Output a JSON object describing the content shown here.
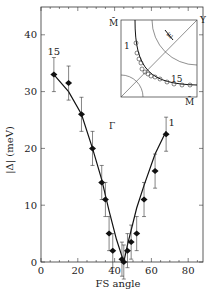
{
  "chart_data": {
    "type": "scatter",
    "title": "",
    "xlabel": "FS angle",
    "ylabel": "|Δ| (meV)",
    "xlim": [
      0,
      90
    ],
    "ylim": [
      0,
      45
    ],
    "xticks": [
      0,
      20,
      40,
      60,
      80
    ],
    "yticks": [
      0,
      10,
      20,
      30,
      40
    ],
    "grid": false,
    "series": [
      {
        "name": "gap data",
        "marker": "filled-diamond",
        "x": [
          7,
          15,
          22,
          28,
          33,
          35,
          37,
          39,
          44,
          45,
          47,
          49,
          52,
          56,
          62,
          68
        ],
        "y": [
          33,
          31.5,
          26,
          20,
          14,
          11,
          5,
          2,
          0.5,
          0,
          2,
          3.5,
          5,
          11,
          16,
          22.5
        ],
        "yerr": [
          3,
          3,
          3,
          3,
          3,
          3,
          3,
          3,
          3,
          3,
          3,
          3,
          3,
          3,
          3,
          3
        ]
      },
      {
        "name": "fit curve",
        "type": "line",
        "x": [
          7,
          15,
          22,
          28,
          33,
          37,
          41,
          44,
          45,
          47,
          52,
          56,
          62,
          68
        ],
        "y": [
          33,
          30,
          26,
          20,
          14.5,
          9,
          4,
          1,
          0,
          3,
          9.5,
          13.5,
          19,
          23
        ]
      }
    ],
    "annotations": [
      {
        "text": "15",
        "x": 7,
        "y": 36.5
      },
      {
        "text": "1",
        "x": 71,
        "y": 24
      }
    ],
    "inset": {
      "type": "diagram",
      "labels": [
        "M̄",
        "Y",
        "E",
        "1",
        "15",
        "Γ",
        "M̄"
      ]
    }
  }
}
